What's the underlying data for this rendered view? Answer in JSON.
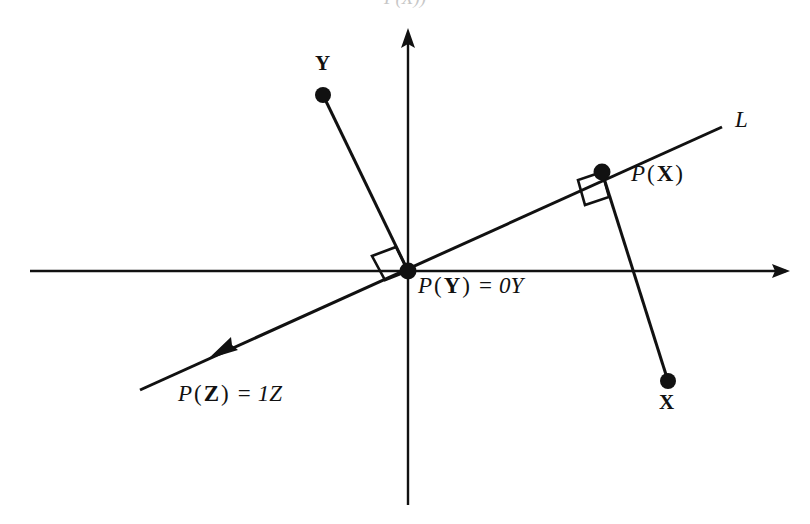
{
  "figure": {
    "type": "geometry-diagram",
    "background_color": "#ffffff",
    "ink_color": "#111111",
    "top_clipped_caption": "P(X))",
    "axes": {
      "origin": {
        "x": 408,
        "y": 271
      },
      "horizontal": {
        "x1": 30,
        "y1": 271,
        "x2": 790,
        "y2": 271,
        "arrow_at": "right"
      },
      "vertical": {
        "x1": 408,
        "y1": 30,
        "x2": 408,
        "y2": 505,
        "arrow_at": "top"
      }
    },
    "line_L": {
      "label": "L",
      "label_pos": {
        "x": 737,
        "y": 122
      },
      "x1": 140,
      "y1": 390,
      "x2": 722,
      "y2": 127,
      "arrow_at": "lower-left",
      "arrow_pos": {
        "x": 222,
        "y": 353
      }
    },
    "points": [
      {
        "name": "Y",
        "label": "Y",
        "style": "bold",
        "dot": {
          "x": 323,
          "y": 95
        },
        "label_pos": {
          "x": 315,
          "y": 62
        }
      },
      {
        "name": "X",
        "label": "X",
        "style": "bold",
        "dot": {
          "x": 668,
          "y": 381
        },
        "label_pos": {
          "x": 660,
          "y": 400
        }
      },
      {
        "name": "P(X)",
        "label": "P(X)",
        "style": "italic",
        "dot": {
          "x": 602,
          "y": 172
        },
        "label_pos": {
          "x": 632,
          "y": 172
        }
      },
      {
        "name": "origin",
        "label": "P(Y) = 0Y",
        "style": "italic",
        "dot": {
          "x": 408,
          "y": 271
        },
        "label_pos": {
          "x": 418,
          "y": 283
        }
      }
    ],
    "segments": [
      {
        "name": "Y-to-origin",
        "x1": 323,
        "y1": 95,
        "x2": 408,
        "y2": 271
      },
      {
        "name": "X-to-PX",
        "x1": 668,
        "y1": 381,
        "x2": 602,
        "y2": 172
      }
    ],
    "right_angles": [
      {
        "name": "right-angle-at-origin",
        "x": 408,
        "y": 271
      },
      {
        "name": "right-angle-at-px",
        "x": 602,
        "y": 172
      }
    ],
    "labels": {
      "point_y": "Y",
      "point_x": "X",
      "line_l": "L",
      "projection_x": {
        "p": "P",
        "open": "(",
        "arg": "X",
        "close": ")"
      },
      "projection_y": {
        "p": "P",
        "open": "(",
        "arg": "Y",
        "close": ")",
        "equals": "=",
        "value": "0Y"
      },
      "projection_z": {
        "p": "P",
        "open": "(",
        "arg": "Z",
        "close": ")",
        "equals": "=",
        "value": "1Z"
      }
    }
  }
}
